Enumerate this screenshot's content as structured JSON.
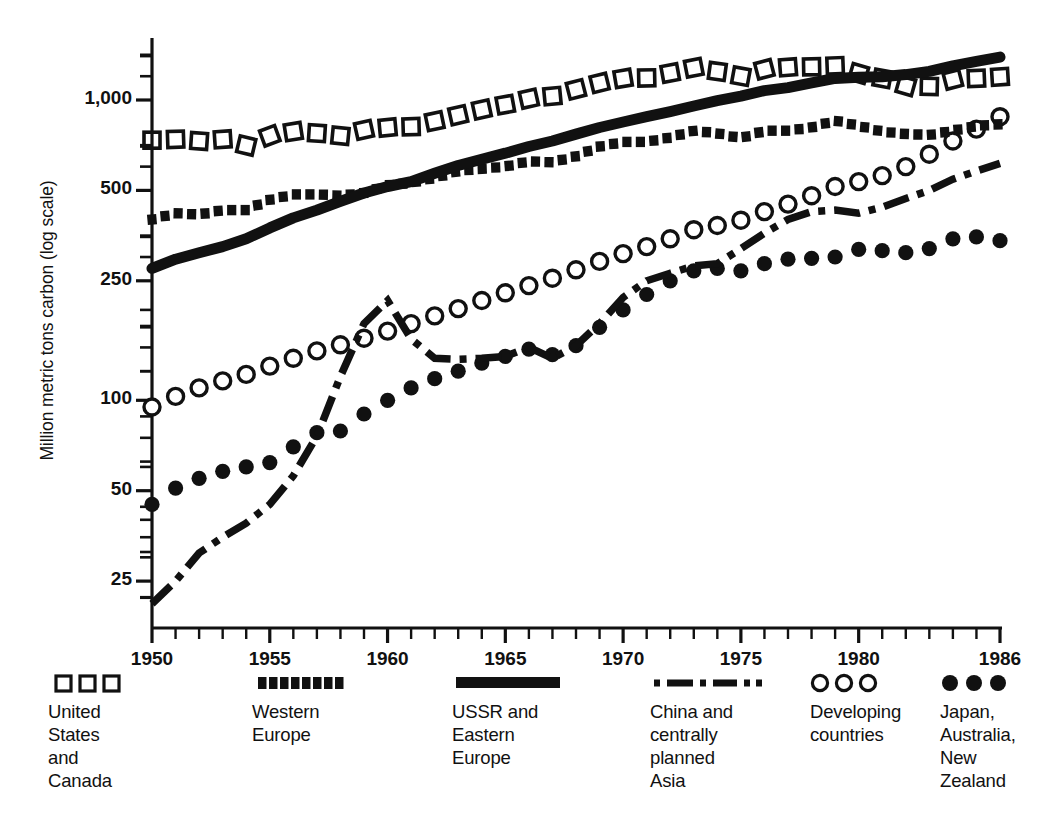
{
  "chart_data": {
    "type": "line",
    "title": "",
    "subtitle": "",
    "xlabel": "",
    "ylabel": "Million metric tons carbon (log scale)",
    "scale": "log",
    "grid": false,
    "legend_position": "bottom",
    "xlim": [
      1950,
      1986
    ],
    "ylim": [
      20,
      1450
    ],
    "x_tick_labels": [
      "1950",
      "1955",
      "1960",
      "1965",
      "1970",
      "1975",
      "1980",
      "1986"
    ],
    "x_tick_values": [
      1950,
      1955,
      1960,
      1965,
      1970,
      1975,
      1980,
      1986
    ],
    "x_minor_tick_step": 1,
    "y_tick_labels": [
      "1,000",
      "500",
      "250",
      "100",
      "50",
      "25"
    ],
    "y_tick_values": [
      1000,
      500,
      250,
      100,
      50,
      25
    ],
    "y_minor_tick_values": [
      1400,
      1200,
      700,
      600,
      350,
      300,
      200,
      175,
      150,
      125,
      75,
      60,
      40,
      35,
      30,
      22
    ],
    "x": [
      1950,
      1951,
      1952,
      1953,
      1954,
      1955,
      1956,
      1957,
      1958,
      1959,
      1960,
      1961,
      1962,
      1963,
      1964,
      1965,
      1966,
      1967,
      1968,
      1969,
      1970,
      1971,
      1972,
      1973,
      1974,
      1975,
      1976,
      1977,
      1978,
      1979,
      1980,
      1981,
      1982,
      1983,
      1984,
      1985,
      1986
    ],
    "series": [
      {
        "name": "United States and Canada",
        "marker": "open-square",
        "line_style": "marker-only",
        "color": "#111111",
        "values": [
          735,
          740,
          730,
          740,
          705,
          760,
          785,
          775,
          760,
          795,
          810,
          815,
          850,
          890,
          930,
          965,
          1010,
          1030,
          1085,
          1140,
          1180,
          1185,
          1230,
          1280,
          1245,
          1200,
          1265,
          1285,
          1290,
          1300,
          1225,
          1180,
          1115,
          1110,
          1170,
          1180,
          1195
        ]
      },
      {
        "name": "Western Europe",
        "marker": "filled-square-dotted",
        "line_style": "dotted-thick",
        "color": "#111111",
        "values": [
          400,
          420,
          415,
          430,
          430,
          465,
          485,
          485,
          480,
          490,
          520,
          530,
          550,
          580,
          590,
          600,
          625,
          620,
          650,
          700,
          725,
          725,
          750,
          790,
          775,
          745,
          790,
          790,
          810,
          855,
          820,
          785,
          770,
          765,
          790,
          820,
          830
        ]
      },
      {
        "name": "USSR and Eastern Europe",
        "marker": "none",
        "line_style": "solid-thick",
        "color": "#111111",
        "values": [
          275,
          295,
          310,
          325,
          345,
          375,
          405,
          430,
          460,
          490,
          515,
          535,
          570,
          605,
          635,
          665,
          700,
          730,
          770,
          810,
          845,
          880,
          915,
          955,
          995,
          1030,
          1075,
          1100,
          1140,
          1180,
          1190,
          1195,
          1215,
          1245,
          1300,
          1345,
          1390
        ]
      },
      {
        "name": "China and centrally planned Asia",
        "marker": "none",
        "line_style": "dash-dot",
        "color": "#111111",
        "values": [
          21,
          25,
          31,
          35,
          39,
          45,
          56,
          76,
          120,
          180,
          215,
          160,
          138,
          137,
          138,
          140,
          150,
          138,
          152,
          180,
          220,
          250,
          265,
          280,
          285,
          320,
          360,
          400,
          425,
          430,
          420,
          440,
          470,
          500,
          545,
          580,
          615
        ]
      },
      {
        "name": "Developing countries",
        "marker": "open-circle",
        "line_style": "marker-only",
        "color": "#111111",
        "values": [
          95,
          103,
          110,
          116,
          122,
          130,
          138,
          146,
          153,
          161,
          170,
          180,
          191,
          202,
          215,
          228,
          241,
          255,
          272,
          290,
          308,
          325,
          345,
          370,
          382,
          398,
          425,
          450,
          480,
          515,
          535,
          560,
          600,
          660,
          730,
          800,
          880
        ]
      },
      {
        "name": "Japan, Australia, New Zealand",
        "marker": "filled-circle",
        "line_style": "marker-only",
        "color": "#111111",
        "values": [
          45,
          51,
          55,
          58,
          60,
          62,
          70,
          78,
          79,
          90,
          100,
          110,
          118,
          125,
          133,
          140,
          148,
          142,
          152,
          175,
          200,
          225,
          250,
          270,
          275,
          270,
          285,
          295,
          297,
          300,
          318,
          315,
          310,
          320,
          345,
          350,
          340
        ]
      }
    ]
  },
  "legend": {
    "items": [
      {
        "swatch": "open-square-row",
        "label": "United\nStates\nand\nCanada"
      },
      {
        "swatch": "filled-square-dotted-row",
        "label": "Western\nEurope"
      },
      {
        "swatch": "solid-bar",
        "label": "USSR and\nEastern\nEurope"
      },
      {
        "swatch": "dash-dot-row",
        "label": "China and\ncentrally\nplanned\nAsia"
      },
      {
        "swatch": "open-circle-row",
        "label": "Developing\ncountries"
      },
      {
        "swatch": "filled-circle-row",
        "label": "Japan,\nAustralia,\nNew\nZealand"
      }
    ]
  },
  "axis": {
    "y_title": "Million metric tons carbon (log scale)"
  }
}
